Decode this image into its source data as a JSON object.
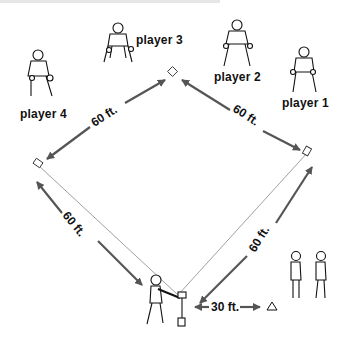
{
  "diagram": {
    "type": "baseball field drill diagram",
    "colors": {
      "line": "#777777",
      "arrow": "#555555",
      "figure": "#111111",
      "text": "#111111"
    },
    "players": [
      {
        "id": "player-1",
        "label": "player 1"
      },
      {
        "id": "player-2",
        "label": "player 2"
      },
      {
        "id": "player-3",
        "label": "player 3"
      },
      {
        "id": "player-4",
        "label": "player 4"
      }
    ],
    "distances": {
      "top_left": "60 ft.",
      "top_right": "60 ft.",
      "bottom_left": "60 ft.",
      "bottom_right": "60 ft.",
      "tee_to_cone": "30 ft."
    },
    "bases": [
      "home-tee",
      "first-base",
      "second-base",
      "third-base"
    ],
    "icons": [
      "batter-icon",
      "tee-icon",
      "cone-icon",
      "waiting-batter-icon"
    ]
  }
}
